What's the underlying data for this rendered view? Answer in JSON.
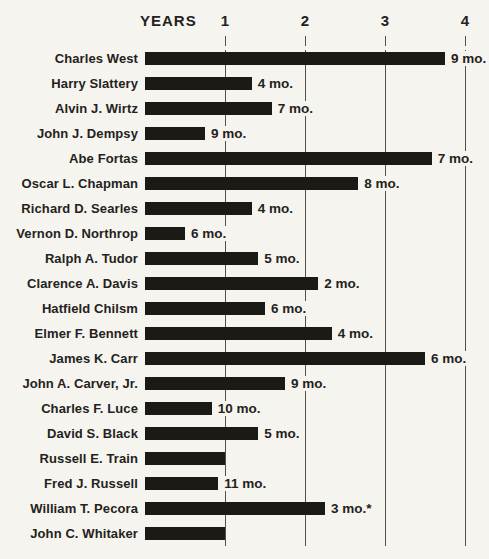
{
  "chart_data": {
    "type": "bar",
    "title": "YEARS",
    "xlabel": "YEARS",
    "ylabel": "",
    "axis_ticks": [
      1,
      2,
      3,
      4
    ],
    "xlim_years": [
      0,
      4
    ],
    "grid": true,
    "unit": "years and months of service; bar length = total tenure, label = months component",
    "people": [
      {
        "name": "Charles West",
        "years": 3,
        "months": 9,
        "total_months": 45,
        "label": "9 mo."
      },
      {
        "name": "Harry Slattery",
        "years": 1,
        "months": 4,
        "total_months": 16,
        "label": "4 mo."
      },
      {
        "name": "Alvin J. Wirtz",
        "years": 1,
        "months": 7,
        "total_months": 19,
        "label": "7 mo."
      },
      {
        "name": "John J. Dempsy",
        "years": 0,
        "months": 9,
        "total_months": 9,
        "label": "9 mo."
      },
      {
        "name": "Abe Fortas",
        "years": 3,
        "months": 7,
        "total_months": 43,
        "label": "7 mo."
      },
      {
        "name": "Oscar L. Chapman",
        "years": 2,
        "months": 8,
        "total_months": 32,
        "label": "8 mo."
      },
      {
        "name": "Richard D. Searles",
        "years": 1,
        "months": 4,
        "total_months": 16,
        "label": "4 mo."
      },
      {
        "name": "Vernon D. Northrop",
        "years": 0,
        "months": 6,
        "total_months": 6,
        "label": "6 mo."
      },
      {
        "name": "Ralph A. Tudor",
        "years": 1,
        "months": 5,
        "total_months": 17,
        "label": "5 mo."
      },
      {
        "name": "Clarence A. Davis",
        "years": 2,
        "months": 2,
        "total_months": 26,
        "label": "2 mo."
      },
      {
        "name": "Hatfield Chilsm",
        "years": 1,
        "months": 6,
        "total_months": 18,
        "label": "6 mo."
      },
      {
        "name": "Elmer F. Bennett",
        "years": 2,
        "months": 4,
        "total_months": 28,
        "label": "4 mo."
      },
      {
        "name": "James K. Carr",
        "years": 3,
        "months": 6,
        "total_months": 42,
        "label": "6 mo."
      },
      {
        "name": "John A. Carver, Jr.",
        "years": 1,
        "months": 9,
        "total_months": 21,
        "label": "9 mo."
      },
      {
        "name": "Charles F. Luce",
        "years": 0,
        "months": 10,
        "total_months": 10,
        "label": "10 mo."
      },
      {
        "name": "David S. Black",
        "years": 1,
        "months": 5,
        "total_months": 17,
        "label": "5 mo."
      },
      {
        "name": "Russell E. Train",
        "years": 1,
        "months": 0,
        "total_months": 12,
        "label": ""
      },
      {
        "name": "Fred J. Russell",
        "years": 0,
        "months": 11,
        "total_months": 11,
        "label": "11 mo."
      },
      {
        "name": "William T. Pecora",
        "years": 2,
        "months": 3,
        "total_months": 27,
        "label": "3 mo.*"
      },
      {
        "name": "John C. Whitaker",
        "years": 1,
        "months": 0,
        "total_months": 12,
        "label": ""
      }
    ]
  },
  "colors": {
    "paper": "#f6f4ef",
    "bar": "#1c1a17",
    "grid": "#55504a",
    "text": "#242220"
  }
}
